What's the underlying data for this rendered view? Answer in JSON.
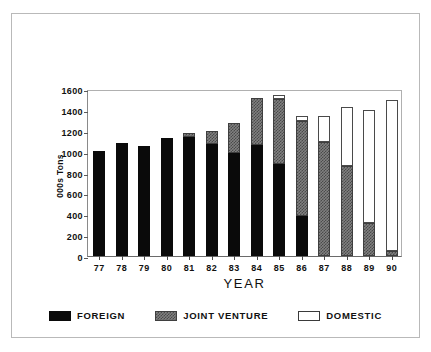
{
  "chart_data": {
    "type": "bar",
    "stacked": true,
    "title": "",
    "xlabel": "YEAR",
    "ylabel": "000s Tons",
    "ylim": [
      0,
      1600
    ],
    "yticks": [
      0,
      200,
      400,
      600,
      800,
      1000,
      1200,
      1400,
      1600
    ],
    "grid": false,
    "legend_position": "bottom",
    "categories": [
      "77",
      "78",
      "79",
      "80",
      "81",
      "82",
      "83",
      "84",
      "85",
      "86",
      "87",
      "88",
      "89",
      "90"
    ],
    "series": [
      {
        "name": "FOREIGN",
        "color": "#0a0a0a",
        "values": [
          1010,
          1080,
          1050,
          1130,
          1140,
          1070,
          990,
          1060,
          880,
          380,
          0,
          0,
          0,
          0
        ]
      },
      {
        "name": "JOINT VENTURE",
        "color": "#808080",
        "values": [
          0,
          0,
          0,
          0,
          40,
          130,
          280,
          450,
          620,
          910,
          1090,
          860,
          320,
          50
        ]
      },
      {
        "name": "DOMESTIC",
        "color": "#ffffff",
        "values": [
          0,
          0,
          0,
          0,
          0,
          0,
          0,
          0,
          40,
          50,
          250,
          570,
          1080,
          1440
        ]
      }
    ],
    "totals": [
      1010,
      1080,
      1050,
      1130,
      1180,
      1200,
      1270,
      1510,
      1540,
      1340,
      1340,
      1430,
      1400,
      1490
    ]
  },
  "legend": {
    "items": [
      {
        "label": "FOREIGN",
        "swatch": "foreign-swatch"
      },
      {
        "label": "JOINT VENTURE",
        "swatch": "joint-venture-swatch"
      },
      {
        "label": "DOMESTIC",
        "swatch": "domestic-swatch"
      }
    ]
  }
}
